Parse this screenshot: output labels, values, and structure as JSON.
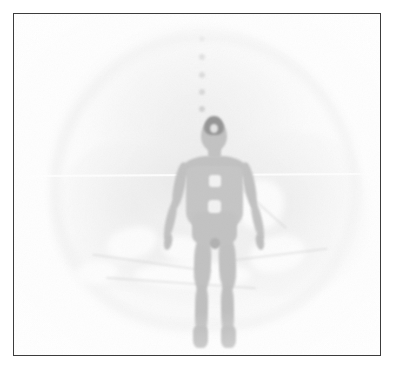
{
  "figure": {
    "caption": "",
    "media_type": "grayscale-scan-image",
    "frame": {
      "border_color": "#3c3c3c",
      "background_color": "#ffffff",
      "plate_color": "#fdfdfd"
    },
    "palette": {
      "page_background": "#ffffff",
      "frame_border": "#3c3c3c",
      "body_silhouette": "#9d9d9d",
      "body_shadow": "#7f7f7f",
      "hair_dark": "#3a3a3a",
      "marker_patch_light": "#e8e8e8",
      "ghost_tissue": "#d6d6d6",
      "scanline_highlight": "#ffffff"
    },
    "subject": {
      "name": "human-body-silhouette",
      "pose": "standing-arms-abducted",
      "orientation": "anterior-view",
      "parts": [
        {
          "name": "head",
          "label": "head"
        },
        {
          "name": "hair",
          "label": "hair-cap"
        },
        {
          "name": "neck",
          "label": "neck"
        },
        {
          "name": "shoulders",
          "label": "shoulders"
        },
        {
          "name": "torso",
          "label": "torso"
        },
        {
          "name": "waist",
          "label": "pelvis"
        },
        {
          "name": "arm-left",
          "label": "left arm"
        },
        {
          "name": "arm-right",
          "label": "right arm"
        },
        {
          "name": "leg-left",
          "label": "left leg"
        },
        {
          "name": "leg-right",
          "label": "right leg"
        }
      ],
      "overlay_patches": [
        {
          "name": "chest-marker",
          "label": "chest marker",
          "tone": "light"
        },
        {
          "name": "abdomen-marker",
          "label": "abdomen marker",
          "tone": "light"
        },
        {
          "name": "pelvic-marker",
          "label": "pelvic marker",
          "tone": "dark"
        }
      ]
    },
    "marker_track": {
      "name": "vertical-dotted-marker-track",
      "axis": "vertical",
      "x": 201,
      "dots": [
        {
          "y": 38,
          "size": 5,
          "opacity": 0.16
        },
        {
          "y": 56,
          "size": 6,
          "opacity": 0.26
        },
        {
          "y": 74,
          "size": 6,
          "opacity": 0.3
        },
        {
          "y": 91,
          "size": 6,
          "opacity": 0.34
        },
        {
          "y": 108,
          "size": 6,
          "opacity": 0.4
        }
      ]
    },
    "background_structures": [
      {
        "name": "scanner-dome",
        "label": "dome volume"
      },
      {
        "name": "cranial-arc",
        "label": "upper arc"
      },
      {
        "name": "ghost-left",
        "label": "left ghost mass"
      },
      {
        "name": "ghost-right",
        "label": "right ghost mass"
      },
      {
        "name": "ghost-core",
        "label": "central mass"
      },
      {
        "name": "ghost-basin",
        "label": "lower basin"
      }
    ],
    "scanline": {
      "name": "horizontal-scan-line",
      "y": 160,
      "color": "#ffffff"
    }
  }
}
